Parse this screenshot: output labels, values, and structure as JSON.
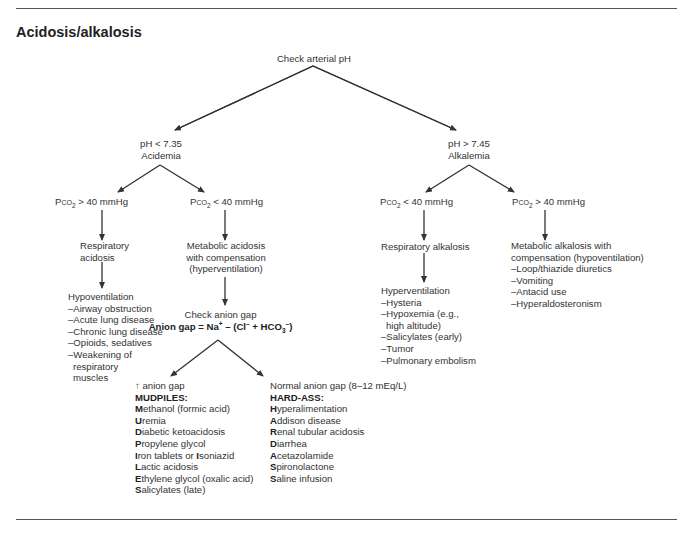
{
  "title": "Acidosis/alkalosis",
  "root": "Check arterial pH",
  "acidemia": {
    "condition": "pH < 7.35",
    "label": "Acidemia"
  },
  "alkalemia": {
    "condition": "pH > 7.45",
    "label": "Alkalemia"
  },
  "pco2_labels": {
    "acid_high": "40 mmHg",
    "acid_low": "40 mmHg",
    "alk_low": "40 mmHg",
    "alk_high": "40 mmHg"
  },
  "resp_acidosis": {
    "line1": "Respiratory",
    "line2": "acidosis"
  },
  "hypoventilation": {
    "heading": "Hypoventilation",
    "items": [
      "–Airway obstruction",
      "–Acute lung disease",
      "–Chronic lung disease",
      "–Opioids, sedatives",
      "–Weakening of",
      "respiratory",
      "muscles"
    ]
  },
  "met_acidosis": {
    "lines": [
      "Metabolic acidosis",
      "with compensation",
      "(hyperventilation)"
    ]
  },
  "anion_gap": {
    "check": "Check anion gap",
    "formula_prefix": "Anion gap = Na",
    "formula_mid": " – (Cl",
    "formula_end": " + HCO",
    "formula_close": ")"
  },
  "high_gap": {
    "heading": "anion gap",
    "mnemonic": "MUDPILES:",
    "items": [
      {
        "first": "M",
        "rest": "ethanol (formic acid)"
      },
      {
        "first": "U",
        "rest": "remia"
      },
      {
        "first": "D",
        "rest": "iabetic ketoacidosis"
      },
      {
        "first": "P",
        "rest": "ropylene glycol"
      },
      {
        "first": "I",
        "rest": "ron tablets or ",
        "first2": "I",
        "rest2": "soniazid"
      },
      {
        "first": "L",
        "rest": "actic acidosis"
      },
      {
        "first": "E",
        "rest": "thylene glycol (oxalic acid)"
      },
      {
        "first": "S",
        "rest": "alicylates (late)"
      }
    ]
  },
  "normal_gap": {
    "heading": "Normal anion gap (8–12 mEq/L)",
    "mnemonic": "HARD-ASS:",
    "items": [
      {
        "first": "H",
        "rest": "yperalimentation"
      },
      {
        "first": "A",
        "rest": "ddison disease"
      },
      {
        "first": "R",
        "rest": "enal tubular acidosis"
      },
      {
        "first": "D",
        "rest": "iarrhea"
      },
      {
        "first": "A",
        "rest": "cetazolamide"
      },
      {
        "first": "S",
        "rest": "pironolactone"
      },
      {
        "first": "S",
        "rest": "aline infusion"
      }
    ]
  },
  "resp_alkalosis": "Respiratory alkalosis",
  "hyperventilation": {
    "heading": "Hyperventilation",
    "items": [
      "–Hysteria",
      "–Hypoxemia (e.g.,",
      " high altitude)",
      "–Salicylates (early)",
      "–Tumor",
      "–Pulmonary embolism"
    ]
  },
  "met_alkalosis": {
    "lines": [
      "Metabolic alkalosis with",
      "compensation (hypoventilation)"
    ],
    "items": [
      "–Loop/thiazide diuretics",
      "–Vomiting",
      "–Antacid use",
      "–Hyperaldosteronism"
    ]
  }
}
